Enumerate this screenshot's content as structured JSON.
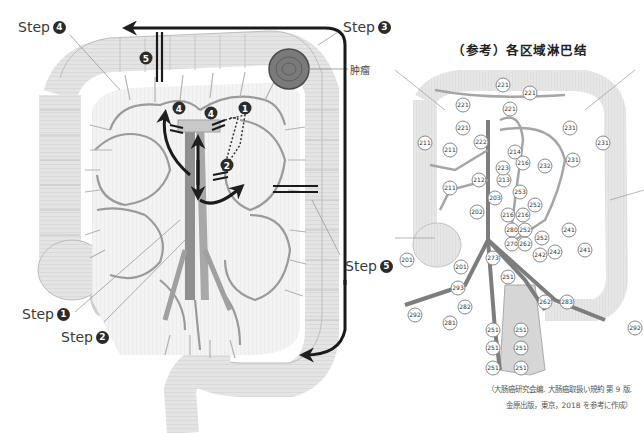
{
  "left_figure": {
    "steps": [
      {
        "id": "step4",
        "label": "Step",
        "num": "4"
      },
      {
        "id": "step3",
        "label": "Step",
        "num": "3"
      },
      {
        "id": "step5",
        "label": "Step",
        "num": "5"
      },
      {
        "id": "step1",
        "label": "Step",
        "num": "1"
      },
      {
        "id": "step2",
        "label": "Step",
        "num": "2"
      }
    ],
    "tumor_label": "肿瘤",
    "inline_badges": [
      "5",
      "4",
      "4",
      "1",
      "2"
    ]
  },
  "right_figure": {
    "title": "（参考）各区域淋巴结",
    "node_labels": [
      "221",
      "221",
      "221",
      "221",
      "221",
      "231",
      "231",
      "231",
      "222",
      "211",
      "211",
      "211",
      "212",
      "213",
      "214",
      "216",
      "223",
      "253",
      "232",
      "202",
      "203",
      "216",
      "216",
      "252",
      "280",
      "252",
      "270",
      "262",
      "242",
      "241",
      "241",
      "201",
      "201",
      "273",
      "251",
      "293",
      "292",
      "282",
      "281",
      "251",
      "251",
      "251",
      "251",
      "251",
      "251",
      "242",
      "252",
      "283",
      "292",
      "262"
    ],
    "caption_line1": "（大肠癌研究会编. 大肠癌取扱い規約 第 9 版.",
    "caption_line2": "金原出版，東京，2018 を参考に作成）"
  }
}
